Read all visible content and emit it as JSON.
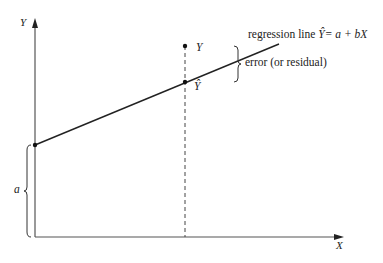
{
  "diagram": {
    "type": "regression-illustration",
    "colors": {
      "ink": "#222222",
      "background": "#ffffff"
    },
    "axes": {
      "y_label": "Y",
      "x_label": "X"
    },
    "regression_line": {
      "label_prefix": "regression line",
      "equation": "Ŷ= a + bX"
    },
    "points": {
      "observed": "Y",
      "predicted": "Ŷ"
    },
    "annotations": {
      "error_label": "error (or residual)",
      "intercept_label": "a"
    }
  }
}
